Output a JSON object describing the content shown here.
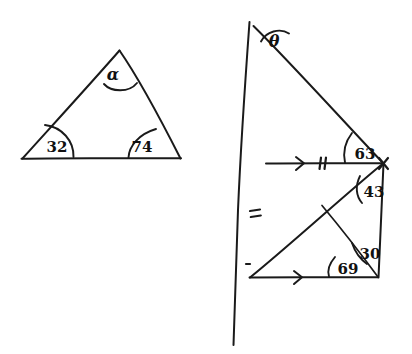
{
  "figure": {
    "background_color": "#ffffff",
    "ink_color": "#1a1a1a"
  },
  "left_triangle": {
    "name": "triangle-with-angles",
    "angles": {
      "apex_label": "α",
      "bottom_left_label": "32",
      "bottom_right_label": "74"
    },
    "vertices": {
      "apex": [
        120,
        50
      ],
      "bottom_left": [
        22,
        158
      ],
      "bottom_right": [
        180,
        158
      ]
    }
  },
  "right_figure": {
    "name": "transversal-parallel-lines-figure",
    "angles": {
      "top_label": "θ",
      "upper_right_label": "63",
      "mid_right_label": "43",
      "lower_right_label": "30",
      "lower_left_label": "69"
    },
    "markers": {
      "parallel_arrow_count": 1,
      "upper_tick_count": 2,
      "transversal_tick_count": 2
    },
    "points": {
      "transversal_top": [
        249,
        22
      ],
      "transversal_bottom": [
        234,
        345
      ],
      "ray_top": [
        254,
        26
      ],
      "vertex_right": [
        383,
        163
      ],
      "upper_parallel_left": [
        266,
        163
      ],
      "lower_parallel_left": [
        250,
        277
      ],
      "lower_parallel_right": [
        378,
        277
      ],
      "interior_point": [
        322,
        205
      ]
    }
  }
}
